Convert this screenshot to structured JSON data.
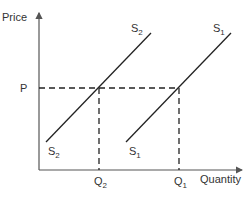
{
  "diagram": {
    "type": "supply-shift",
    "axes": {
      "y_label": "Price",
      "x_label": "Quantity"
    },
    "price_label": "P",
    "quantity_labels": {
      "q1": {
        "main": "Q",
        "sub": "1"
      },
      "q2": {
        "main": "Q",
        "sub": "2"
      }
    },
    "curves": [
      {
        "name": "S2",
        "main": "S",
        "sub": "2",
        "from": [
          46,
          142
        ],
        "to": [
          151,
          33
        ]
      },
      {
        "name": "S1",
        "main": "S",
        "sub": "1",
        "from": [
          126,
          142
        ],
        "to": [
          231,
          33
        ]
      }
    ],
    "equilibria": [
      {
        "name": "E2",
        "x": 99,
        "y": 88
      },
      {
        "name": "E1",
        "x": 179,
        "y": 88
      }
    ],
    "colors": {
      "line": "#222222",
      "axis": "#555555",
      "text": "#333333"
    }
  }
}
